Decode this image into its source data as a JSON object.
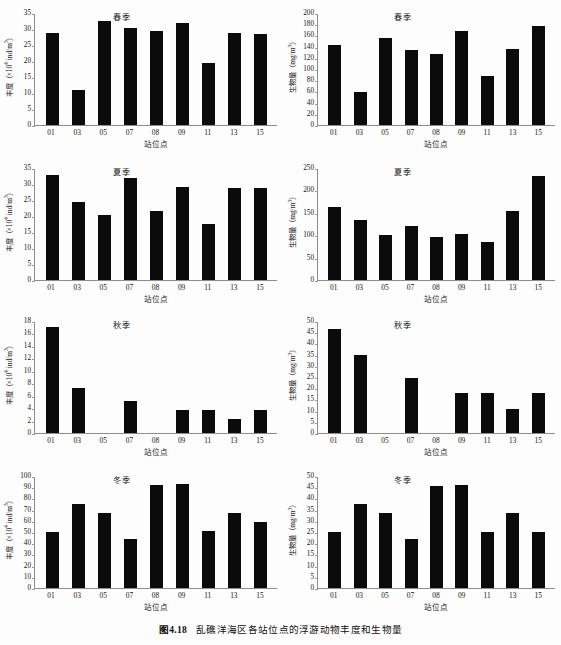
{
  "figure": {
    "caption_number": "图4.18",
    "caption_text": "乱礁洋海区各站位点的浮游动物丰度和生物量"
  },
  "axis_titles": {
    "x": "站位点",
    "y_abundance": "丰度（×10⁴ ind/m³）",
    "y_biomass": "生物量（mg/m³）"
  },
  "seasons": {
    "spring": "春季",
    "summer": "夏季",
    "autumn": "秋季",
    "winter": "冬季"
  },
  "stations": [
    "01",
    "03",
    "05",
    "07",
    "08",
    "09",
    "11",
    "13",
    "15"
  ],
  "chart_data": [
    {
      "id": "spring-abundance",
      "type": "bar",
      "title": "春季",
      "xlabel": "站位点",
      "ylabel": "丰度（×10⁴ ind/m³）",
      "categories": [
        "01",
        "03",
        "05",
        "07",
        "08",
        "09",
        "11",
        "13",
        "15"
      ],
      "values": [
        28.7,
        10.8,
        32.6,
        30.4,
        29.3,
        31.9,
        19.3,
        28.9,
        28.3
      ],
      "ylim": [
        0,
        35
      ],
      "yticks": [
        0,
        5,
        10,
        15,
        20,
        25,
        30,
        35
      ],
      "grid": false,
      "legend": "none"
    },
    {
      "id": "spring-biomass",
      "type": "bar",
      "title": "春季",
      "xlabel": "站位点",
      "ylabel": "生物量（mg/m³）",
      "categories": [
        "01",
        "03",
        "05",
        "07",
        "08",
        "09",
        "11",
        "13",
        "15"
      ],
      "values": [
        142,
        59,
        156,
        134,
        127,
        167,
        88,
        136,
        177
      ],
      "ylim": [
        0,
        200
      ],
      "yticks": [
        0,
        20,
        40,
        60,
        80,
        100,
        120,
        140,
        160,
        180,
        200
      ],
      "grid": false,
      "legend": "none"
    },
    {
      "id": "summer-abundance",
      "type": "bar",
      "title": "夏季",
      "xlabel": "站位点",
      "ylabel": "丰度（×10⁴ ind/m³）",
      "categories": [
        "01",
        "03",
        "05",
        "07",
        "08",
        "09",
        "11",
        "13",
        "15"
      ],
      "values": [
        32.9,
        24.4,
        20.4,
        31.9,
        21.6,
        29.1,
        17.4,
        28.9,
        28.9
      ],
      "ylim": [
        0,
        35
      ],
      "yticks": [
        0,
        5,
        10,
        15,
        20,
        25,
        30,
        35
      ],
      "grid": false,
      "legend": "none"
    },
    {
      "id": "summer-biomass",
      "type": "bar",
      "title": "夏季",
      "xlabel": "站位点",
      "ylabel": "生物量（mg/m³）",
      "categories": [
        "01",
        "03",
        "05",
        "07",
        "08",
        "09",
        "11",
        "13",
        "15"
      ],
      "values": [
        163,
        133,
        100,
        120,
        97,
        102,
        85,
        155,
        232
      ],
      "ylim": [
        0,
        250
      ],
      "yticks": [
        0,
        50,
        100,
        150,
        200,
        250
      ],
      "grid": false,
      "legend": "none"
    },
    {
      "id": "autumn-abundance",
      "type": "bar",
      "title": "秋季",
      "xlabel": "站位点",
      "ylabel": "丰度（×10⁴ ind/m³）",
      "categories": [
        "01",
        "03",
        "05",
        "07",
        "08",
        "09",
        "11",
        "13",
        "15"
      ],
      "values": [
        17.1,
        7.2,
        0,
        5.1,
        0,
        3.7,
        3.7,
        2.2,
        3.7
      ],
      "ylim": [
        0,
        18
      ],
      "yticks": [
        0,
        2,
        4,
        6,
        8,
        10,
        12,
        14,
        16,
        18
      ],
      "grid": false,
      "legend": "none"
    },
    {
      "id": "autumn-biomass",
      "type": "bar",
      "title": "秋季",
      "xlabel": "站位点",
      "ylabel": "生物量（mg/m³）",
      "categories": [
        "01",
        "03",
        "05",
        "07",
        "08",
        "09",
        "11",
        "13",
        "15"
      ],
      "values": [
        46.5,
        35.0,
        0,
        24.5,
        0,
        17.7,
        17.7,
        10.7,
        17.7
      ],
      "ylim": [
        0,
        50
      ],
      "yticks": [
        0,
        5,
        10,
        15,
        20,
        25,
        30,
        35,
        40,
        45,
        50
      ],
      "grid": false,
      "legend": "none"
    },
    {
      "id": "winter-abundance",
      "type": "bar",
      "title": "冬季",
      "xlabel": "站位点",
      "ylabel": "丰度（×10⁴ ind/m³）",
      "categories": [
        "01",
        "03",
        "05",
        "07",
        "08",
        "09",
        "11",
        "13",
        "15"
      ],
      "values": [
        50,
        75,
        67,
        44,
        92,
        92.5,
        50.5,
        67,
        58.5
      ],
      "ylim": [
        0,
        100
      ],
      "yticks": [
        0,
        10,
        20,
        30,
        40,
        50,
        60,
        70,
        80,
        90,
        100
      ],
      "grid": false,
      "legend": "none"
    },
    {
      "id": "winter-biomass",
      "type": "bar",
      "title": "冬季",
      "xlabel": "站位点",
      "ylabel": "生物量（mg/m³）",
      "categories": [
        "01",
        "03",
        "05",
        "07",
        "08",
        "09",
        "11",
        "13",
        "15"
      ],
      "values": [
        25,
        37.3,
        33.3,
        22,
        45.7,
        46,
        25,
        33.3,
        25
      ],
      "ylim": [
        0,
        50
      ],
      "yticks": [
        0,
        5,
        10,
        15,
        20,
        25,
        30,
        35,
        40,
        45,
        50
      ],
      "grid": false,
      "legend": "none"
    }
  ],
  "colors": {
    "bar": "#0b0b0b",
    "axis": "#8d8d8d",
    "text": "#111111",
    "background": "#fdfdfd"
  }
}
